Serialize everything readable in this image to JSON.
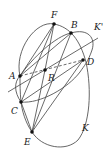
{
  "diagram": {
    "labels": {
      "F": "F",
      "B": "B",
      "K_prime": "K'",
      "D": "D",
      "A": "A",
      "R": "R",
      "C": "C",
      "E": "E",
      "K": "K"
    },
    "points": {
      "F": [
        54,
        24
      ],
      "B": [
        71,
        33
      ],
      "D": [
        83,
        60
      ],
      "A": [
        20,
        76
      ],
      "R": [
        45,
        70
      ],
      "C": [
        21,
        102
      ],
      "E": [
        32,
        132
      ]
    },
    "curves": [
      {
        "name": "K",
        "through": [
          "F",
          "B",
          "D",
          "E",
          "C",
          "A"
        ]
      },
      {
        "name": "K'",
        "through": [
          "A",
          "B",
          "D",
          "C"
        ]
      }
    ],
    "segments": [
      [
        "A",
        "F"
      ],
      [
        "A",
        "B"
      ],
      [
        "F",
        "R"
      ],
      [
        "F",
        "C"
      ],
      [
        "B",
        "E"
      ],
      [
        "R",
        "E"
      ],
      [
        "C",
        "D"
      ]
    ],
    "dashed": [
      [
        "A",
        "R",
        "D"
      ]
    ],
    "extended_line": [
      "D",
      "lower-left"
    ]
  }
}
